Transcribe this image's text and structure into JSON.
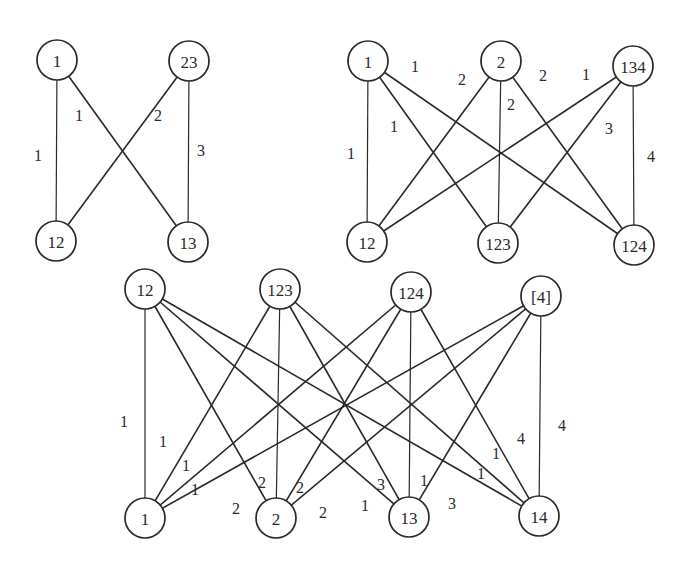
{
  "diagram": {
    "type": "bipartite-graphs",
    "line_color": "#2a2a2a",
    "background": "#ffffff",
    "node_radius": 20,
    "graphs": [
      {
        "id": "graph-a",
        "nodes": [
          {
            "id": "a-1",
            "label": "1",
            "x": 57,
            "y": 60
          },
          {
            "id": "a-23",
            "label": "23",
            "x": 189,
            "y": 61
          },
          {
            "id": "a-12",
            "label": "12",
            "x": 56,
            "y": 241
          },
          {
            "id": "a-13",
            "label": "13",
            "x": 188,
            "y": 242
          }
        ],
        "edges": [
          {
            "from": "a-1",
            "to": "a-12",
            "label": "1",
            "lx": 38,
            "ly": 155,
            "vertical": true
          },
          {
            "from": "a-1",
            "to": "a-13",
            "label": "1",
            "lx": 79,
            "ly": 115
          },
          {
            "from": "a-23",
            "to": "a-12",
            "label": "2",
            "lx": 158,
            "ly": 115
          },
          {
            "from": "a-23",
            "to": "a-13",
            "label": "3",
            "lx": 201,
            "ly": 150,
            "vertical": true
          }
        ]
      },
      {
        "id": "graph-b",
        "nodes": [
          {
            "id": "b-1",
            "label": "1",
            "x": 368,
            "y": 61
          },
          {
            "id": "b-2",
            "label": "2",
            "x": 501,
            "y": 61
          },
          {
            "id": "b-134",
            "label": "134",
            "x": 633,
            "y": 66
          },
          {
            "id": "b-12",
            "label": "12",
            "x": 367,
            "y": 242
          },
          {
            "id": "b-123",
            "label": "123",
            "x": 498,
            "y": 243
          },
          {
            "id": "b-124",
            "label": "124",
            "x": 634,
            "y": 245
          }
        ],
        "edges": [
          {
            "from": "b-1",
            "to": "b-12",
            "label": "1",
            "lx": 351,
            "ly": 153,
            "vertical": true
          },
          {
            "from": "b-1",
            "to": "b-123",
            "label": "1",
            "lx": 394,
            "ly": 126
          },
          {
            "from": "b-1",
            "to": "b-124",
            "label": "1",
            "lx": 415,
            "ly": 66
          },
          {
            "from": "b-2",
            "to": "b-12",
            "label": "2",
            "lx": 462,
            "ly": 79
          },
          {
            "from": "b-2",
            "to": "b-123",
            "label": "2",
            "lx": 511,
            "ly": 104,
            "vertical": true
          },
          {
            "from": "b-2",
            "to": "b-124",
            "label": "2",
            "lx": 543,
            "ly": 75
          },
          {
            "from": "b-134",
            "to": "b-12",
            "label": "1",
            "lx": 586,
            "ly": 74
          },
          {
            "from": "b-134",
            "to": "b-123",
            "label": "3",
            "lx": 609,
            "ly": 128
          },
          {
            "from": "b-134",
            "to": "b-124",
            "label": "4",
            "lx": 651,
            "ly": 156,
            "vertical": true
          }
        ]
      },
      {
        "id": "graph-c",
        "nodes": [
          {
            "id": "c-12",
            "label": "12",
            "x": 145,
            "y": 289
          },
          {
            "id": "c-123",
            "label": "123",
            "x": 280,
            "y": 289
          },
          {
            "id": "c-124",
            "label": "124",
            "x": 411,
            "y": 292
          },
          {
            "id": "c-4",
            "label": "[4]",
            "x": 541,
            "y": 296
          },
          {
            "id": "c-1",
            "label": "1",
            "x": 145,
            "y": 518
          },
          {
            "id": "c-2",
            "label": "2",
            "x": 276,
            "y": 518
          },
          {
            "id": "c-13",
            "label": "13",
            "x": 409,
            "y": 517
          },
          {
            "id": "c-14",
            "label": "14",
            "x": 539,
            "y": 516
          }
        ],
        "edges": [
          {
            "from": "c-12",
            "to": "c-1",
            "label": "1",
            "lx": 124,
            "ly": 421,
            "vertical": true
          },
          {
            "from": "c-12",
            "to": "c-2",
            "label": "2",
            "lx": 236,
            "ly": 508
          },
          {
            "from": "c-12",
            "to": "c-13",
            "label": "1",
            "lx": 365,
            "ly": 505
          },
          {
            "from": "c-12",
            "to": "c-14",
            "label": "1",
            "lx": 481,
            "ly": 473
          },
          {
            "from": "c-123",
            "to": "c-1",
            "label": "1",
            "lx": 163,
            "ly": 441
          },
          {
            "from": "c-123",
            "to": "c-2",
            "label": "2",
            "lx": 262,
            "ly": 482,
            "vertical": true
          },
          {
            "from": "c-123",
            "to": "c-13",
            "label": "3",
            "lx": 381,
            "ly": 484
          },
          {
            "from": "c-123",
            "to": "c-14",
            "label": "1",
            "lx": 496,
            "ly": 453
          },
          {
            "from": "c-124",
            "to": "c-1",
            "label": "1",
            "lx": 186,
            "ly": 465
          },
          {
            "from": "c-124",
            "to": "c-2",
            "label": "2",
            "lx": 300,
            "ly": 487
          },
          {
            "from": "c-124",
            "to": "c-13",
            "label": "1",
            "lx": 424,
            "ly": 480,
            "vertical": true
          },
          {
            "from": "c-124",
            "to": "c-14",
            "label": "4",
            "lx": 521,
            "ly": 438
          },
          {
            "from": "c-4",
            "to": "c-1",
            "label": "1",
            "lx": 195,
            "ly": 489
          },
          {
            "from": "c-4",
            "to": "c-2",
            "label": "2",
            "lx": 323,
            "ly": 512
          },
          {
            "from": "c-4",
            "to": "c-13",
            "label": "3",
            "lx": 452,
            "ly": 503
          },
          {
            "from": "c-4",
            "to": "c-14",
            "label": "4",
            "lx": 562,
            "ly": 425,
            "vertical": true
          }
        ]
      }
    ]
  }
}
